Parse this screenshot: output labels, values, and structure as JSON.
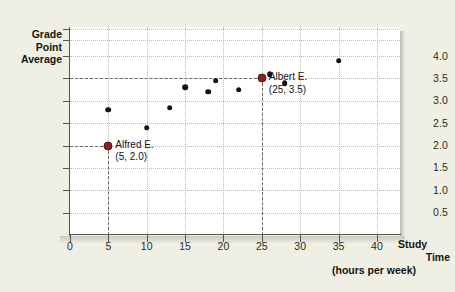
{
  "chart_data": {
    "type": "scatter",
    "title": "",
    "xlabel": "Study Time (hours per week)",
    "ylabel": "Grade Point Average",
    "ylabel_lines": [
      "Grade",
      "Point",
      "Average"
    ],
    "xlabel_lines": [
      "Study",
      "Time"
    ],
    "xlabel_sub": "(hours per week)",
    "xlim": [
      0,
      43
    ],
    "ylim": [
      0,
      4.65
    ],
    "xticks": [
      0,
      5,
      10,
      15,
      20,
      25,
      30,
      35,
      40
    ],
    "xtick_labels": [
      "0",
      "5",
      "10",
      "15",
      "20",
      "25",
      "30",
      "35",
      "40"
    ],
    "yticks": [
      0.5,
      1.0,
      1.5,
      2.0,
      2.5,
      3.0,
      3.5,
      4.0,
      4.35,
      4.6
    ],
    "ytick_labels": [
      "0.5",
      "1.0",
      "1.5",
      "2.0",
      "2.5",
      "3.0",
      "3.5",
      "4.0",
      "",
      ""
    ],
    "grid": true,
    "legend": null,
    "points": [
      {
        "x": 5,
        "y": 2.0,
        "highlight": true,
        "label": "Alfred E."
      },
      {
        "x": 5,
        "y": 2.8,
        "highlight": false,
        "label": ""
      },
      {
        "x": 10,
        "y": 2.4,
        "highlight": false,
        "label": ""
      },
      {
        "x": 13,
        "y": 2.85,
        "highlight": false,
        "label": ""
      },
      {
        "x": 15,
        "y": 3.3,
        "highlight": false,
        "label": ""
      },
      {
        "x": 18,
        "y": 3.2,
        "highlight": false,
        "label": ""
      },
      {
        "x": 19,
        "y": 3.45,
        "highlight": false,
        "label": ""
      },
      {
        "x": 22,
        "y": 3.25,
        "highlight": false,
        "label": ""
      },
      {
        "x": 25,
        "y": 3.5,
        "highlight": true,
        "label": "Albert E."
      },
      {
        "x": 26,
        "y": 3.6,
        "highlight": false,
        "label": ""
      },
      {
        "x": 28,
        "y": 3.4,
        "highlight": false,
        "label": ""
      },
      {
        "x": 35,
        "y": 3.9,
        "highlight": false,
        "label": ""
      }
    ],
    "annotations": [
      {
        "name": "Alfred E.",
        "coords": "(5, 2.0)",
        "x": 5,
        "y": 2.0
      },
      {
        "name": "Albert E.",
        "coords": "(25, 3.5)",
        "x": 25,
        "y": 3.5
      }
    ],
    "colors": {
      "background": "#efefe4",
      "plot_background": "#ffffff",
      "point": "#15150f",
      "highlight_point": "#8b2221",
      "gridline": "#bdbdb4",
      "axis": "#55554d",
      "guide": "#6a6a61",
      "text": "#15150f"
    }
  }
}
